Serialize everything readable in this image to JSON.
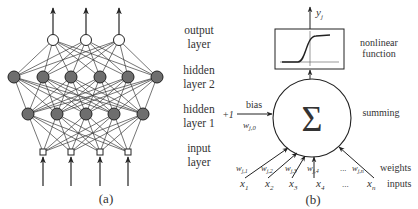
{
  "panel_a": {
    "caption": "(a)",
    "layers": {
      "output": {
        "line1": "output",
        "line2": "layer",
        "nodes": 3
      },
      "hidden2": {
        "line1": "hidden",
        "line2": "layer 2",
        "nodes": 6
      },
      "hidden1": {
        "line1": "hidden",
        "line2": "layer 1",
        "nodes": 5
      },
      "input": {
        "line1": "input",
        "line2": "layer",
        "nodes": 4
      }
    },
    "colors": {
      "hidden_node_fill": "#6e6e6e",
      "edge": "#333333"
    }
  },
  "panel_b": {
    "caption": "(b)",
    "output_label": "y",
    "output_sub": "j",
    "nonlinear_label_1": "nonlinear",
    "nonlinear_label_2": "function",
    "summing_symbol": "Σ",
    "summing_label": "summing",
    "bias_label": "bias",
    "bias_input": "+1",
    "bias_weight": "w",
    "bias_weight_sub": "j,0",
    "weights_label": "weights",
    "inputs_label": "inputs",
    "ellipsis": "...",
    "weights": [
      {
        "w": "w",
        "sub": "j,1"
      },
      {
        "w": "w",
        "sub": "j,2"
      },
      {
        "w": "w",
        "sub": "j,3"
      },
      {
        "w": "w",
        "sub": "j,4"
      },
      {
        "w": "w",
        "sub": "j,n"
      }
    ],
    "inputs": [
      {
        "x": "x",
        "sub": "1"
      },
      {
        "x": "x",
        "sub": "2"
      },
      {
        "x": "x",
        "sub": "3"
      },
      {
        "x": "x",
        "sub": "4"
      },
      {
        "x": "x",
        "sub": "n"
      }
    ]
  }
}
